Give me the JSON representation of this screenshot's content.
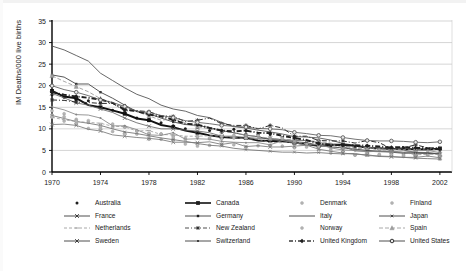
{
  "chart_data": {
    "type": "line",
    "title": "",
    "xlabel": "",
    "ylabel": "IM Deaths/000 live births",
    "xlim": [
      1970,
      2003
    ],
    "ylim": [
      0,
      35
    ],
    "ytick_step": 5,
    "yticks": [
      "0",
      "5",
      "10",
      "15",
      "20",
      "25",
      "30",
      "35"
    ],
    "xticks": [
      "1970",
      "1974",
      "1978",
      "1982",
      "1986",
      "1990",
      "1994",
      "1998",
      "2002"
    ],
    "grid": "horizontal",
    "legend_position": "bottom",
    "legend_columns": 4,
    "x": [
      1970,
      1971,
      1972,
      1973,
      1974,
      1975,
      1976,
      1977,
      1978,
      1979,
      1980,
      1981,
      1982,
      1983,
      1984,
      1985,
      1986,
      1987,
      1988,
      1989,
      1990,
      1991,
      1992,
      1993,
      1994,
      1995,
      1996,
      1997,
      1998,
      1999,
      2000,
      2001,
      2002
    ],
    "series": [
      {
        "name": "Australia",
        "marker": "dot",
        "line": "none",
        "color": "#1a1a1a",
        "values": [
          17.9,
          17.3,
          16.7,
          16.5,
          16.1,
          14.3,
          13.8,
          12.5,
          12.2,
          11.4,
          10.7,
          10.0,
          10.3,
          9.6,
          9.2,
          9.9,
          8.8,
          8.7,
          8.7,
          8.0,
          8.2,
          7.1,
          7.0,
          6.1,
          5.9,
          5.7,
          5.8,
          5.3,
          5.0,
          5.7,
          5.2,
          5.3,
          5.0
        ]
      },
      {
        "name": "Canada",
        "marker": "square",
        "line": "solid-bold",
        "color": "#111111",
        "values": [
          18.8,
          17.5,
          17.1,
          15.5,
          15.0,
          14.3,
          13.5,
          12.4,
          12.0,
          10.9,
          10.4,
          9.6,
          9.1,
          8.5,
          8.1,
          7.9,
          7.9,
          7.3,
          7.2,
          7.1,
          6.8,
          6.4,
          6.1,
          6.3,
          6.3,
          6.1,
          5.6,
          5.5,
          5.3,
          5.3,
          5.3,
          5.2,
          5.4
        ]
      },
      {
        "name": "Denmark",
        "marker": "dot-light",
        "line": "none",
        "color": "#8c8c8c",
        "values": [
          14.2,
          13.5,
          12.2,
          11.5,
          10.7,
          10.4,
          10.4,
          8.8,
          8.9,
          8.8,
          8.4,
          7.9,
          8.2,
          7.7,
          7.7,
          7.9,
          8.3,
          8.3,
          7.5,
          7.9,
          7.5,
          7.3,
          6.6,
          5.4,
          5.5,
          5.1,
          5.2,
          5.3,
          4.7,
          4.2,
          5.3,
          4.9,
          4.4
        ]
      },
      {
        "name": "Finland",
        "marker": "dot-light",
        "line": "none",
        "color": "#9a9a9a",
        "values": [
          13.2,
          11.8,
          11.1,
          10.1,
          10.1,
          9.4,
          9.0,
          9.5,
          7.6,
          7.6,
          7.6,
          6.5,
          6.0,
          6.2,
          6.5,
          6.3,
          5.8,
          6.1,
          6.1,
          6.0,
          5.6,
          5.8,
          5.2,
          4.4,
          4.7,
          3.9,
          4.0,
          3.9,
          4.2,
          3.6,
          3.8,
          4.2,
          3.0
        ]
      },
      {
        "name": "France",
        "marker": "x",
        "line": "solid",
        "color": "#666666",
        "values": [
          18.2,
          17.2,
          16.0,
          15.5,
          14.6,
          13.8,
          12.5,
          11.4,
          10.6,
          10.0,
          10.0,
          9.7,
          9.5,
          9.1,
          8.3,
          8.3,
          8.0,
          7.8,
          7.8,
          7.5,
          7.3,
          7.3,
          6.8,
          6.5,
          5.9,
          4.9,
          4.8,
          4.7,
          4.6,
          4.3,
          4.4,
          4.5,
          4.1
        ]
      },
      {
        "name": "Germany",
        "marker": "square-sm",
        "line": "solid",
        "color": "#3a3a3a",
        "values": [
          22.5,
          22.0,
          20.4,
          20.4,
          18.5,
          17.1,
          15.5,
          14.0,
          13.5,
          12.5,
          11.6,
          11.0,
          10.8,
          10.3,
          9.6,
          9.1,
          8.5,
          8.2,
          7.5,
          7.4,
          7.0,
          6.8,
          6.2,
          5.8,
          5.6,
          5.3,
          5.0,
          4.8,
          4.7,
          4.5,
          4.4,
          4.3,
          4.2
        ]
      },
      {
        "name": "Italy",
        "marker": "line-only",
        "line": "solid",
        "color": "#4d4d4d",
        "values": [
          29.2,
          28.3,
          27.0,
          25.7,
          22.9,
          21.2,
          19.5,
          18.0,
          17.0,
          15.5,
          14.6,
          14.1,
          13.1,
          12.6,
          11.5,
          10.5,
          10.2,
          9.7,
          9.3,
          8.8,
          8.2,
          8.1,
          7.9,
          7.4,
          6.6,
          6.2,
          5.8,
          5.5,
          5.3,
          5.1,
          4.5,
          4.4,
          4.3
        ]
      },
      {
        "name": "Japan",
        "marker": "x-sm",
        "line": "solid",
        "color": "#707070",
        "values": [
          13.1,
          12.4,
          11.7,
          11.3,
          10.8,
          10.0,
          9.3,
          8.9,
          8.4,
          7.9,
          7.5,
          7.1,
          6.6,
          6.2,
          6.0,
          5.5,
          5.2,
          5.0,
          4.8,
          4.6,
          4.6,
          4.4,
          4.5,
          4.3,
          4.2,
          4.3,
          3.8,
          3.7,
          3.6,
          3.4,
          3.2,
          3.1,
          3.0
        ]
      },
      {
        "name": "Netherlands",
        "marker": "dash",
        "line": "dashed-light",
        "color": "#999999",
        "values": [
          12.7,
          12.1,
          11.7,
          11.5,
          11.3,
          10.6,
          10.5,
          9.5,
          9.6,
          8.7,
          8.6,
          8.3,
          8.3,
          8.4,
          8.3,
          8.0,
          7.7,
          7.6,
          6.8,
          6.8,
          7.1,
          6.5,
          6.3,
          6.3,
          5.6,
          5.5,
          5.7,
          5.0,
          5.2,
          5.2,
          5.1,
          5.4,
          5.0
        ]
      },
      {
        "name": "New Zealand",
        "marker": "star",
        "line": "dash-dot",
        "color": "#2b2b2b",
        "values": [
          16.7,
          16.6,
          16.2,
          16.1,
          15.9,
          15.9,
          14.2,
          14.2,
          14.0,
          13.0,
          12.9,
          11.7,
          12.0,
          12.5,
          11.2,
          10.8,
          10.8,
          10.0,
          10.8,
          10.2,
          8.3,
          8.3,
          7.3,
          7.2,
          7.2,
          6.7,
          7.3,
          6.8,
          5.4,
          5.6,
          6.3,
          5.6,
          5.6
        ]
      },
      {
        "name": "Norway",
        "marker": "dot-light",
        "line": "none",
        "color": "#a0a0a0",
        "values": [
          12.7,
          12.8,
          11.8,
          11.9,
          10.5,
          11.1,
          10.5,
          9.5,
          9.0,
          8.8,
          8.1,
          7.5,
          8.1,
          7.9,
          8.3,
          8.5,
          7.9,
          8.4,
          8.0,
          7.7,
          6.9,
          6.4,
          5.9,
          5.0,
          5.2,
          4.0,
          4.1,
          4.1,
          4.0,
          3.9,
          3.8,
          3.9,
          3.5
        ]
      },
      {
        "name": "Spain",
        "marker": "tri-light",
        "line": "dash-light",
        "color": "#8f8f8f",
        "values": [
          22.3,
          21.0,
          19.8,
          18.6,
          17.0,
          16.0,
          15.0,
          14.0,
          13.0,
          12.0,
          12.3,
          11.4,
          10.5,
          10.0,
          9.5,
          9.0,
          8.6,
          8.2,
          7.8,
          7.5,
          7.6,
          7.2,
          7.1,
          6.7,
          6.0,
          5.5,
          5.5,
          5.5,
          4.9,
          4.5,
          4.0,
          4.1,
          4.1
        ]
      },
      {
        "name": "Sweden",
        "marker": "x",
        "line": "solid",
        "color": "#777777",
        "values": [
          11.0,
          11.1,
          10.8,
          9.9,
          9.5,
          8.6,
          8.3,
          8.0,
          7.8,
          7.5,
          6.9,
          6.9,
          6.8,
          7.0,
          6.4,
          6.8,
          5.9,
          6.1,
          5.8,
          5.8,
          6.0,
          6.2,
          5.3,
          4.8,
          4.4,
          4.1,
          4.0,
          3.6,
          3.5,
          3.4,
          3.4,
          3.7,
          3.3
        ]
      },
      {
        "name": "Switzerland",
        "marker": "dot-sm",
        "line": "solid",
        "color": "#858585",
        "values": [
          15.1,
          14.4,
          13.3,
          13.2,
          12.5,
          10.7,
          10.7,
          9.8,
          8.6,
          8.5,
          9.1,
          7.6,
          7.7,
          7.6,
          7.1,
          6.9,
          6.8,
          6.8,
          6.3,
          7.3,
          6.8,
          6.2,
          6.4,
          5.6,
          5.1,
          5.0,
          4.7,
          4.8,
          4.8,
          4.6,
          4.9,
          5.0,
          4.5
        ]
      },
      {
        "name": "United Kingdom",
        "marker": "diamond",
        "line": "dash-dot-bold",
        "color": "#1f1f1f",
        "values": [
          18.5,
          17.9,
          17.5,
          17.2,
          16.8,
          16.0,
          14.5,
          14.1,
          13.3,
          12.9,
          12.1,
          11.2,
          11.0,
          10.2,
          9.6,
          9.4,
          9.6,
          9.1,
          9.0,
          8.4,
          7.9,
          7.4,
          6.6,
          6.3,
          6.2,
          6.2,
          6.1,
          5.9,
          5.7,
          5.8,
          5.6,
          5.5,
          5.3
        ]
      },
      {
        "name": "United States",
        "marker": "circle",
        "line": "solid",
        "color": "#5a5a5a",
        "values": [
          20.0,
          19.1,
          18.5,
          17.7,
          16.7,
          16.1,
          15.2,
          14.1,
          13.8,
          13.1,
          12.6,
          11.9,
          11.5,
          11.2,
          10.8,
          10.6,
          10.4,
          10.1,
          10.0,
          9.8,
          9.2,
          8.9,
          8.5,
          8.4,
          8.0,
          7.6,
          7.3,
          7.2,
          7.2,
          7.1,
          6.9,
          6.8,
          7.0
        ]
      }
    ]
  },
  "legend": {
    "rows": [
      [
        {
          "label": "Australia",
          "glyph": "dot"
        },
        {
          "label": "Canada",
          "glyph": "square"
        },
        {
          "label": "Denmark",
          "glyph": "dot-light"
        },
        {
          "label": "Finland",
          "glyph": "dot-light"
        }
      ],
      [
        {
          "label": "France",
          "glyph": "x"
        },
        {
          "label": "Germany",
          "glyph": "square-sm"
        },
        {
          "label": "Italy",
          "glyph": "line-only"
        },
        {
          "label": "Japan",
          "glyph": "x-sm"
        }
      ],
      [
        {
          "label": "Netherlands",
          "glyph": "dash"
        },
        {
          "label": "New Zealand",
          "glyph": "star"
        },
        {
          "label": "Norway",
          "glyph": "dot-light"
        },
        {
          "label": "Spain",
          "glyph": "tri-light"
        }
      ],
      [
        {
          "label": "Sweden",
          "glyph": "x"
        },
        {
          "label": "Switzerland",
          "glyph": "dot-sm"
        },
        {
          "label": "United Kingdom",
          "glyph": "diamond"
        },
        {
          "label": "United States",
          "glyph": "circle"
        }
      ]
    ]
  }
}
